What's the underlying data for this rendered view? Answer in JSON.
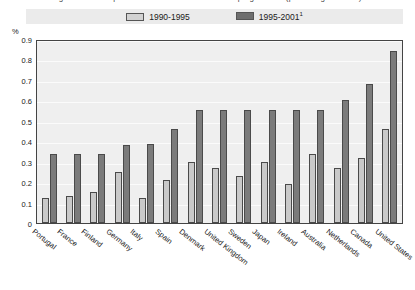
{
  "title": {
    "text": "Figure: Public expenditure on active labour market programmes (percentage of GDP)"
  },
  "legend": {
    "position": "top-center",
    "items": [
      {
        "label": "1990-1995",
        "swatch": "light",
        "color": "#d2d2d2"
      },
      {
        "label": "1995-2001",
        "superscript": "1",
        "swatch": "dark",
        "color": "#6e6e6e"
      }
    ]
  },
  "axis": {
    "y_unit": "%",
    "y_ticks": [
      "0.9",
      "0.8",
      "0.7",
      "0.6",
      "0.5",
      "0.4",
      "0.3",
      "0.2",
      "0.1",
      "0"
    ]
  },
  "chart_data": {
    "type": "bar",
    "title": "",
    "xlabel": "",
    "ylabel": "%",
    "ylim": [
      0,
      0.9
    ],
    "ytick_step": 0.1,
    "grid": true,
    "legend_position": "top-center",
    "categories": [
      "Portugal",
      "France",
      "Finland",
      "Germany",
      "Italy",
      "Spain",
      "Denmark",
      "United Kingdom",
      "Sweden",
      "Japan",
      "Ireland",
      "Australia",
      "Netherlands",
      "Canada",
      "United States"
    ],
    "series": [
      {
        "name": "1990-1995",
        "color": "#c9c9c9",
        "values": [
          0.12,
          0.13,
          0.15,
          0.25,
          0.12,
          0.21,
          0.3,
          0.27,
          0.23,
          0.3,
          0.19,
          0.34,
          0.27,
          0.32,
          0.46
        ]
      },
      {
        "name": "1995-2001",
        "color": "#7b7b7b",
        "values": [
          0.34,
          0.34,
          0.34,
          0.38,
          0.385,
          0.46,
          0.555,
          0.555,
          0.555,
          0.555,
          0.555,
          0.555,
          0.6,
          0.68,
          0.84
        ]
      }
    ]
  }
}
